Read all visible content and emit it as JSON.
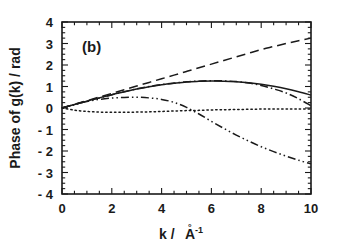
{
  "figure": {
    "panel_label": "(b)",
    "background_color": "#ffffff",
    "ink_color": "#1a1a1a"
  },
  "axes": {
    "x": {
      "label_prefix": "k / ",
      "label_element": "A",
      "label_ring": "°",
      "label_exponent": "-1",
      "label_full": "k / Å-1",
      "min": 0,
      "max": 10,
      "major_step": 2,
      "minor_step": 0.5,
      "ticks": [
        "0",
        "2",
        "4",
        "6",
        "8",
        "10"
      ]
    },
    "y": {
      "label_full": "Phase of g(k) / rad",
      "min": -4,
      "max": 4,
      "major_step": 1,
      "minor_step": 0.25,
      "ticks": [
        "4",
        "3",
        "2",
        "1",
        "0",
        "- 1",
        "- 2",
        "- 3",
        "- 4"
      ]
    }
  },
  "chart_data": {
    "type": "line",
    "title": "(b)",
    "xlabel": "k / Å-1",
    "ylabel": "Phase of g(k) / rad",
    "xlim": [
      0,
      10
    ],
    "ylim": [
      -4,
      4
    ],
    "grid": false,
    "legend": "none",
    "x": [
      0,
      0.5,
      1,
      1.5,
      2,
      2.5,
      3,
      3.5,
      4,
      4.5,
      5,
      5.5,
      6,
      6.5,
      7,
      7.5,
      8,
      8.5,
      9,
      9.5,
      10
    ],
    "series": [
      {
        "name": "solid-curve",
        "style": "solid",
        "color": "#1a1a1a",
        "values": [
          0.0,
          0.16,
          0.32,
          0.47,
          0.62,
          0.75,
          0.88,
          0.99,
          1.08,
          1.15,
          1.21,
          1.24,
          1.26,
          1.25,
          1.22,
          1.17,
          1.1,
          1.01,
          0.9,
          0.76,
          0.6
        ]
      },
      {
        "name": "dashed-curve",
        "style": "dashed",
        "color": "#1a1a1a",
        "values": [
          0.0,
          0.17,
          0.34,
          0.51,
          0.68,
          0.85,
          1.02,
          1.19,
          1.36,
          1.53,
          1.7,
          1.87,
          2.04,
          2.21,
          2.38,
          2.55,
          2.72,
          2.86,
          3.0,
          3.13,
          3.25
        ]
      },
      {
        "name": "dotted-curve",
        "style": "dotted",
        "color": "#1a1a1a",
        "values": [
          0.0,
          -0.1,
          -0.16,
          -0.19,
          -0.2,
          -0.2,
          -0.19,
          -0.18,
          -0.16,
          -0.14,
          -0.12,
          -0.11,
          -0.09,
          -0.08,
          -0.07,
          -0.06,
          -0.05,
          -0.05,
          -0.05,
          -0.05,
          -0.05
        ]
      },
      {
        "name": "dash-dot-curve",
        "style": "dash-dot",
        "color": "#1a1a1a",
        "values": [
          0.0,
          0.16,
          0.32,
          0.47,
          0.62,
          0.76,
          0.89,
          1.0,
          1.09,
          1.16,
          1.22,
          1.25,
          1.27,
          1.26,
          1.23,
          1.16,
          1.05,
          0.89,
          0.7,
          0.43,
          0.1
        ]
      },
      {
        "name": "dash-dot-dot-curve",
        "style": "dash-dot-dot",
        "color": "#1a1a1a",
        "values": [
          0.0,
          0.16,
          0.3,
          0.4,
          0.46,
          0.49,
          0.5,
          0.47,
          0.4,
          0.26,
          0.03,
          -0.28,
          -0.62,
          -0.95,
          -1.26,
          -1.54,
          -1.8,
          -2.03,
          -2.24,
          -2.43,
          -2.6
        ]
      }
    ]
  }
}
